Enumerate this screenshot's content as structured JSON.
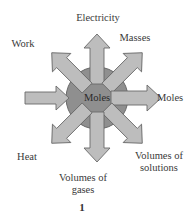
{
  "diagram": {
    "center": {
      "label": "Moles",
      "fill": "#8f8f8f",
      "stroke": "#6a6a6a"
    },
    "arrow_fill": "#bdbdbd",
    "arrow_stroke": "#6a6a6a",
    "arrows": [
      {
        "direction": "N",
        "label": "Electricity"
      },
      {
        "direction": "NE",
        "label": "Masses"
      },
      {
        "direction": "E",
        "label": "Moles"
      },
      {
        "direction": "SE",
        "label_line1": "Volumes of",
        "label_line2": "solutions"
      },
      {
        "direction": "S",
        "label_line1": "Volumes of",
        "label_line2": "gases"
      },
      {
        "direction": "SW",
        "label": "Heat"
      },
      {
        "direction": "W",
        "label": ""
      },
      {
        "direction": "NW",
        "label": "Work"
      }
    ],
    "figure_number": "1"
  }
}
